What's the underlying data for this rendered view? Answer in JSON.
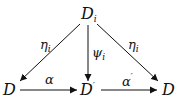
{
  "diagram": {
    "type": "commutative-diagram",
    "nodes": {
      "top": {
        "base": "D",
        "sub": "i",
        "sup": ""
      },
      "bottom_left": {
        "base": "D",
        "sub": "",
        "sup": ""
      },
      "bottom_middle": {
        "base": "D",
        "sub": "",
        "sup": "′"
      },
      "bottom_right": {
        "base": "D",
        "sub": "",
        "sup": ""
      }
    },
    "arrows": {
      "top_to_left": {
        "base": "η",
        "sub": "i"
      },
      "top_to_middle": {
        "base": "ψ",
        "sub": "i"
      },
      "top_to_right": {
        "base": "η",
        "sub": "i"
      },
      "left_to_middle": {
        "base": "α",
        "sup": ""
      },
      "middle_to_right": {
        "base": "α",
        "sup": "′"
      }
    }
  }
}
